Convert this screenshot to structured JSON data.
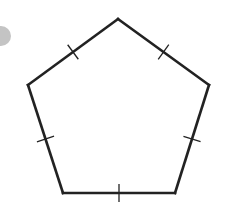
{
  "diagram": {
    "shape": "pentagon",
    "sides": 5,
    "all_sides_congruent": true,
    "tick_marks_per_side": 1,
    "stroke_color": "#222222",
    "side_labels": [
      "top-left side",
      "top-right side",
      "right side",
      "bottom side",
      "left side"
    ],
    "decoration": {
      "partial_circle_color": "#c4c4c4"
    }
  }
}
